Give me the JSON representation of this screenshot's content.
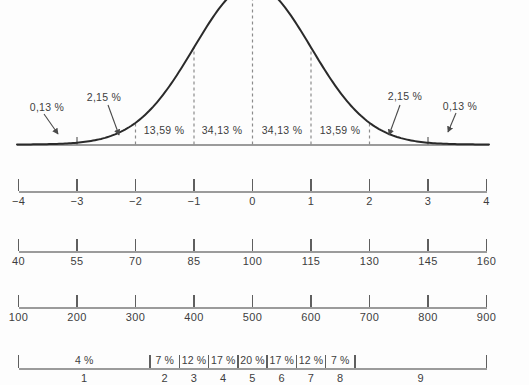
{
  "chart_data": {
    "type": "area",
    "title": "",
    "curve": {
      "distribution": "normal",
      "mean_z": 0,
      "sd_z": 1,
      "z_range": [
        -4,
        4
      ],
      "grid": false,
      "dashed_guides_at_z": [
        -2,
        -1,
        0,
        1,
        2
      ],
      "solid_ticks_at_z": [
        -3,
        3
      ]
    },
    "segment_percentages": {
      "labels": [
        "0,13 %",
        "2,15 %",
        "13,59 %",
        "34,13 %",
        "34,13 %",
        "13,59 %",
        "2,15 %",
        "0,13 %"
      ],
      "values": [
        0.13,
        2.15,
        13.59,
        34.13,
        34.13,
        13.59,
        2.15,
        0.13
      ],
      "band_boundaries_z": [
        -4,
        -3,
        -2,
        -1,
        0,
        1,
        2,
        3,
        4
      ]
    },
    "scales": [
      {
        "name": "z-score-scale",
        "tick_labels": [
          "−4",
          "−3",
          "−2",
          "−1",
          "0",
          "1",
          "2",
          "3",
          "4"
        ],
        "tick_values": [
          -4,
          -3,
          -2,
          -1,
          0,
          1,
          2,
          3,
          4
        ]
      },
      {
        "name": "iq-scale",
        "tick_labels": [
          "40",
          "55",
          "70",
          "85",
          "100",
          "115",
          "130",
          "145",
          "160"
        ],
        "tick_values": [
          40,
          55,
          70,
          85,
          100,
          115,
          130,
          145,
          160
        ]
      },
      {
        "name": "standard-score-scale",
        "tick_labels": [
          "100",
          "200",
          "300",
          "400",
          "500",
          "600",
          "700",
          "800",
          "900"
        ],
        "tick_values": [
          100,
          200,
          300,
          400,
          500,
          600,
          700,
          800,
          900
        ]
      }
    ],
    "stanine_scale": {
      "name": "stanine-scale",
      "region_labels": [
        "1",
        "2",
        "3",
        "4",
        "5",
        "6",
        "7",
        "8",
        "9"
      ],
      "percent_labels": [
        "4 %",
        "7 %",
        "12 %",
        "17 %",
        "20 %",
        "17 %",
        "12 %",
        "7 %",
        ""
      ],
      "percent_values": [
        4,
        7,
        12,
        17,
        20,
        17,
        12,
        7,
        null
      ],
      "boundary_z": [
        -1.75,
        -1.25,
        -0.75,
        -0.25,
        0.25,
        0.75,
        1.25,
        1.75
      ]
    },
    "colors": {
      "curve": "#2a2a2a",
      "baseline": "#9b9b9b",
      "dashed_guide": "#8c8c8c",
      "tick": "#5f5f5f",
      "text": "#3d3d3d"
    }
  }
}
